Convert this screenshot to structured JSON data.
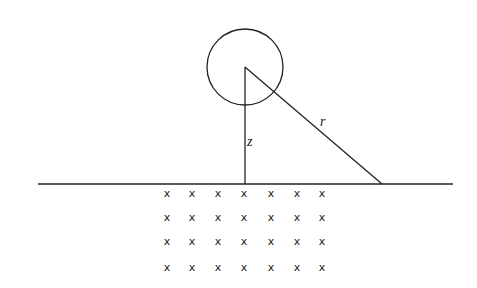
{
  "diagram": {
    "labels": {
      "z": "z",
      "r": "r"
    },
    "circle": {
      "cx": 245,
      "cy": 67,
      "r": 38
    },
    "surface_line": {
      "x1": 38,
      "x2": 453,
      "y": 184
    },
    "vertical_z": {
      "x": 245,
      "y1": 67,
      "y2": 184
    },
    "hypotenuse_r": {
      "x1": 245,
      "y1": 67,
      "x2": 382,
      "y2": 184
    },
    "grid_marker": "x",
    "grid_columns": [
      167,
      192,
      218,
      244,
      271,
      297,
      322
    ],
    "grid_rows": [
      193,
      217,
      241,
      267
    ]
  }
}
